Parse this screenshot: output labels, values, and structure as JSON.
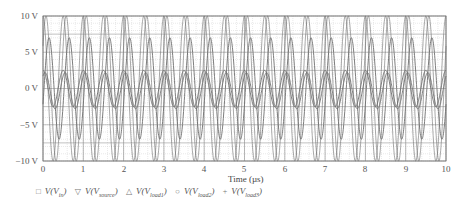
{
  "chart_data": {
    "type": "line",
    "title": "",
    "xlabel": "Time (µs)",
    "ylabel": "",
    "xlim": [
      0,
      10
    ],
    "ylim": [
      -10,
      10
    ],
    "grid": true,
    "x_ticks": [
      "0",
      "1",
      "2",
      "3",
      "4",
      "5",
      "6",
      "7",
      "8",
      "9",
      "10"
    ],
    "y_ticks": [
      "10 V",
      "5 V",
      "0 V",
      "−5 V",
      "−10 V"
    ],
    "legend_position": "bottom",
    "frequency_mhz": 2,
    "series": [
      {
        "name": "V(V_in)",
        "marker": "square",
        "amplitude": 10,
        "offset": 0,
        "phase": 0
      },
      {
        "name": "V(V_source)",
        "marker": "triangle-down",
        "amplitude": 10,
        "offset": 0,
        "phase": 0.15
      },
      {
        "name": "V(V_load1)",
        "marker": "triangle-up",
        "amplitude": 2.5,
        "offset": 0,
        "phase": 0
      },
      {
        "name": "V(V_load2)",
        "marker": "circle",
        "amplitude": 2.5,
        "offset": -0.3,
        "phase": 0.1
      },
      {
        "name": "V(V_load3)",
        "marker": "plus",
        "amplitude": 7,
        "offset": 0,
        "phase": 0.3
      }
    ]
  },
  "axis": {
    "xlabel": "Time (µs)",
    "yticks": [
      "10 V",
      "5 V",
      "0 V",
      "−5 V",
      "−10 V"
    ],
    "xticks": [
      "0",
      "1",
      "2",
      "3",
      "4",
      "5",
      "6",
      "7",
      "8",
      "9",
      "10"
    ]
  },
  "legend": [
    {
      "marker": "□",
      "prefix": "V(V",
      "sub": "in",
      "suffix": ")"
    },
    {
      "marker": "▽",
      "prefix": "V(V",
      "sub": "source",
      "suffix": ")"
    },
    {
      "marker": "△",
      "prefix": "V(V",
      "sub": "load1",
      "suffix": ")"
    },
    {
      "marker": "○",
      "prefix": "V(V",
      "sub": "load2",
      "suffix": ")"
    },
    {
      "marker": "+",
      "prefix": "V(V",
      "sub": "load3",
      "suffix": ")"
    }
  ],
  "colors": {
    "grid_major": "#9a9a9a",
    "grid_minor": "#d4d4d4",
    "trace": "#6e6e6e",
    "axis_text": "#555555"
  }
}
